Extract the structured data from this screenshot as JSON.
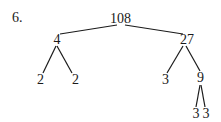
{
  "problem_number": "6.",
  "tree": {
    "root": "108",
    "left": {
      "value": "4",
      "children": [
        "2",
        "2"
      ]
    },
    "right": {
      "value": "27",
      "children": [
        "3",
        "9"
      ]
    },
    "right_right": {
      "value": "9",
      "children": [
        "3",
        "3"
      ]
    }
  }
}
